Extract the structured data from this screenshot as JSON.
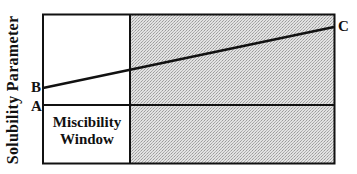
{
  "diagram": {
    "y_axis_label": "Solubility  Parameter",
    "points": {
      "A": "A",
      "B": "B",
      "C": "C"
    },
    "region_label_line1": "Miscibility",
    "region_label_line2": "Window",
    "colors": {
      "line": "#111111",
      "shaded_region": "#d4d4d4",
      "background": "#ffffff"
    }
  }
}
